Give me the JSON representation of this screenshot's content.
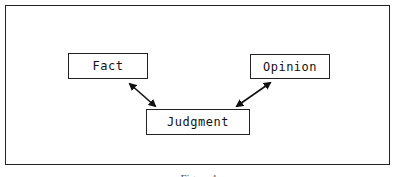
{
  "diagram": {
    "nodes": [
      {
        "id": "fact",
        "label": "Fact"
      },
      {
        "id": "judgment",
        "label": "Judgment"
      },
      {
        "id": "opinion",
        "label": "Opinion"
      }
    ],
    "edges": [
      {
        "from": "fact",
        "to": "judgment",
        "type": "bidirectional"
      },
      {
        "from": "opinion",
        "to": "judgment",
        "type": "bidirectional"
      }
    ],
    "caption": "Figure 1"
  }
}
